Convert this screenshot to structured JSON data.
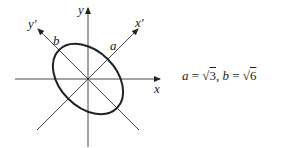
{
  "diagram": {
    "type": "rotated-ellipse-axes",
    "axes": {
      "x_label": "x",
      "y_label": "y",
      "x_prime_label": "x′",
      "y_prime_label": "y′"
    },
    "semi_axis_labels": {
      "a": "a",
      "b": "b"
    },
    "rotation_degrees": 45
  },
  "equation": {
    "a_var": "a",
    "a_eq": " = √",
    "a_val": "3",
    "sep": ",  ",
    "b_var": "b",
    "b_eq": " = √",
    "b_val": "6"
  }
}
